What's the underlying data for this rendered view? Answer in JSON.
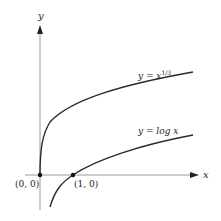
{
  "diagram": {
    "axes": {
      "x_label": "x",
      "y_label": "y"
    },
    "curves": [
      {
        "name": "cube-root",
        "label_prefix": "y = x",
        "label_sup": "1/3",
        "color": "#2a2a2a"
      },
      {
        "name": "log",
        "label": "y = log x",
        "color": "#2a2a2a"
      }
    ],
    "points": [
      {
        "label": "(0, 0)"
      },
      {
        "label": "(1, 0)"
      }
    ],
    "axis_color": "#888888"
  }
}
